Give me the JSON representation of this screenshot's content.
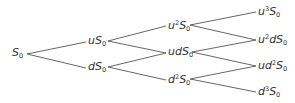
{
  "diagram": {
    "type": "binomial-tree",
    "title": "",
    "line_color": "#555555",
    "text_color": "#333333",
    "nodes": [
      {
        "id": "n0",
        "step": 0,
        "x": 12,
        "y": 54,
        "label": "S0",
        "html": "<i>S</i><sub>0</sub>"
      },
      {
        "id": "n1u",
        "step": 1,
        "x": 88,
        "y": 42,
        "label": "uS0",
        "html": "<i>uS</i><sub>0</sub>"
      },
      {
        "id": "n1d",
        "step": 1,
        "x": 88,
        "y": 68,
        "label": "dS0",
        "html": "<i>dS</i><sub>0</sub>"
      },
      {
        "id": "n2uu",
        "step": 2,
        "x": 168,
        "y": 26,
        "label": "u^2S0",
        "html": "<i>u</i><sup>2</sup><i>S</i><sub>0</sub>"
      },
      {
        "id": "n2ud",
        "step": 2,
        "x": 168,
        "y": 53,
        "label": "udS0",
        "html": "<i>udS</i><sub>0</sub>"
      },
      {
        "id": "n2dd",
        "step": 2,
        "x": 168,
        "y": 80,
        "label": "d^2S0",
        "html": "<i>d</i><sup>2</sup><i>S</i><sub>0</sub>"
      },
      {
        "id": "n3uuu",
        "step": 3,
        "x": 258,
        "y": 12,
        "label": "u^3S0",
        "html": "<i>u</i><sup>3</sup><i>S</i><sub>0</sub>"
      },
      {
        "id": "n3uud",
        "step": 3,
        "x": 258,
        "y": 40,
        "label": "u^2dS0",
        "html": "<i>u</i><sup>2</sup><i>dS</i><sub>0</sub>"
      },
      {
        "id": "n3udd",
        "step": 3,
        "x": 258,
        "y": 66,
        "label": "ud^2S0",
        "html": "<i>ud</i><sup>2</sup><i>S</i><sub>0</sub>"
      },
      {
        "id": "n3ddd",
        "step": 3,
        "x": 258,
        "y": 92,
        "label": "d^3S0",
        "html": "<i>d</i><sup>3</sup><i>S</i><sub>0</sub>"
      }
    ],
    "edges": [
      {
        "from": "n0",
        "to": "n1u",
        "x1": 27,
        "y1": 54,
        "x2": 86,
        "y2": 42
      },
      {
        "from": "n0",
        "to": "n1d",
        "x1": 27,
        "y1": 54,
        "x2": 86,
        "y2": 68
      },
      {
        "from": "n1u",
        "to": "n2uu",
        "x1": 108,
        "y1": 41,
        "x2": 166,
        "y2": 26
      },
      {
        "from": "n1u",
        "to": "n2ud",
        "x1": 108,
        "y1": 41,
        "x2": 166,
        "y2": 53
      },
      {
        "from": "n1d",
        "to": "n2ud",
        "x1": 108,
        "y1": 67,
        "x2": 166,
        "y2": 53
      },
      {
        "from": "n1d",
        "to": "n2dd",
        "x1": 108,
        "y1": 67,
        "x2": 166,
        "y2": 80
      },
      {
        "from": "n2uu",
        "to": "n3uuu",
        "x1": 190,
        "y1": 25,
        "x2": 256,
        "y2": 12
      },
      {
        "from": "n2uu",
        "to": "n3uud",
        "x1": 190,
        "y1": 25,
        "x2": 256,
        "y2": 40
      },
      {
        "from": "n2ud",
        "to": "n3uud",
        "x1": 192,
        "y1": 52,
        "x2": 256,
        "y2": 40
      },
      {
        "from": "n2ud",
        "to": "n3udd",
        "x1": 192,
        "y1": 52,
        "x2": 256,
        "y2": 66
      },
      {
        "from": "n2dd",
        "to": "n3udd",
        "x1": 190,
        "y1": 79,
        "x2": 256,
        "y2": 66
      },
      {
        "from": "n2dd",
        "to": "n3ddd",
        "x1": 190,
        "y1": 79,
        "x2": 256,
        "y2": 92
      }
    ]
  }
}
